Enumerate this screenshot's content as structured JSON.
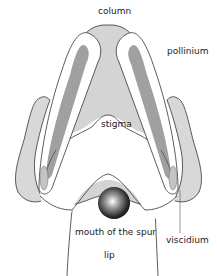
{
  "figure": {
    "type": "labeled-diagram"
  },
  "labels": {
    "column": "column",
    "pollinium": "pollinium",
    "stigma": "stigma",
    "mouth_of_spur": "mouth of the spur",
    "lip": "lip",
    "viscidium": "viscidium"
  },
  "colors": {
    "outline": "#333333",
    "column_fill": "#d4d4d4",
    "pollinium_fill": "#a0a0a0",
    "anther_fill": "#ffffff",
    "wing_fill": "#d8d8d8",
    "background": "#ffffff",
    "spur_highlight": "#ffffff",
    "spur_dark": "#111111"
  }
}
